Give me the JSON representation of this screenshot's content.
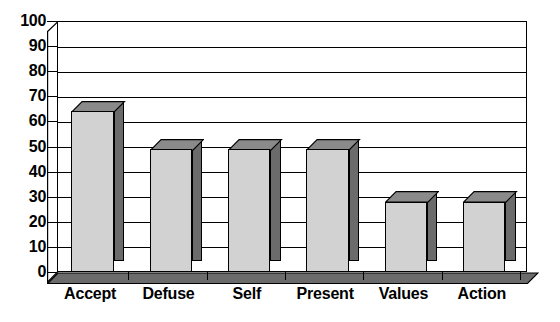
{
  "chart_data": {
    "type": "bar",
    "title": "",
    "subtitle": "",
    "xlabel": "",
    "ylabel": "",
    "categories": [
      "Accept",
      "Defuse",
      "Self",
      "Present",
      "Values",
      "Action"
    ],
    "values": [
      64,
      49,
      49,
      49,
      28,
      28
    ],
    "ylim": [
      0,
      100
    ],
    "ytick_step": 10,
    "yticks": [
      100,
      90,
      80,
      70,
      60,
      50,
      40,
      30,
      20,
      10,
      0
    ],
    "ytick_labels": [
      "100",
      "90",
      "80",
      "70",
      "60",
      "50",
      "40",
      "30",
      "20",
      "10",
      "0"
    ],
    "grid": true,
    "grid_axis": "y",
    "legend": false,
    "legend_position": "none",
    "style": "3d-column",
    "colors": {
      "bar_front": "#d2d2d2",
      "bar_side": "#6b6b6b",
      "bar_top": "#8a8a8a",
      "outline": "#000000",
      "plot_background": "#ffffff",
      "floor": "#6b6b6b",
      "wall": "#bdbdbd"
    }
  }
}
